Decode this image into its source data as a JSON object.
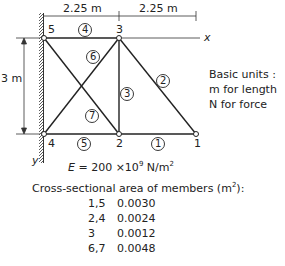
{
  "figure": {
    "dimensions": {
      "top_left": "2.25 m",
      "top_right": "2.25 m",
      "height": "3 m"
    },
    "axes": {
      "x": "x",
      "y": "y"
    },
    "nodes": [
      {
        "id": "1",
        "x": 196,
        "y": 134
      },
      {
        "id": "2",
        "x": 119,
        "y": 134
      },
      {
        "id": "3",
        "x": 119,
        "y": 38
      },
      {
        "id": "4",
        "x": 44,
        "y": 134
      },
      {
        "id": "5",
        "x": 44,
        "y": 38
      }
    ],
    "members": [
      {
        "id": "1",
        "from": "2",
        "to": "1"
      },
      {
        "id": "2",
        "from": "3",
        "to": "1"
      },
      {
        "id": "3",
        "from": "3",
        "to": "2"
      },
      {
        "id": "4",
        "from": "5",
        "to": "3"
      },
      {
        "id": "5",
        "from": "4",
        "to": "2"
      },
      {
        "id": "6",
        "from": "4",
        "to": "3"
      },
      {
        "id": "7",
        "from": "5",
        "to": "2"
      }
    ],
    "node_labels": {
      "n1": "1",
      "n2": "2",
      "n3": "3",
      "n4": "4",
      "n5": "5"
    },
    "member_labels": {
      "m1": "1",
      "m2": "2",
      "m3": "3",
      "m4": "4",
      "m5": "5",
      "m6": "6",
      "m7": "7"
    }
  },
  "basic_units": {
    "title": "Basic units :",
    "length": "m for length",
    "force": "N for force"
  },
  "modulus": {
    "symbol": "E",
    "equals": " = 200 ×10",
    "exponent": "9",
    "unit": " N/m",
    "unit_exp": "2"
  },
  "area_section": {
    "title": "Cross-sectional area of members (m",
    "title_exp": "2",
    "title_end": "):",
    "rows": [
      {
        "members": "1,5",
        "area": "0.0030"
      },
      {
        "members": "2,4",
        "area": "0.0024"
      },
      {
        "members": "3",
        "area": "0.0012"
      },
      {
        "members": "6,7",
        "area": "0.0048"
      }
    ]
  }
}
